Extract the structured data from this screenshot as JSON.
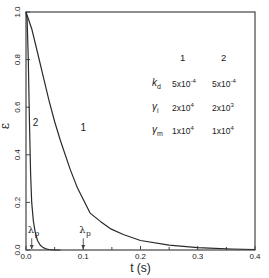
{
  "chart_data": {
    "type": "line",
    "title": "",
    "xlabel": "t (s)",
    "ylabel": "ε",
    "xlim": [
      0,
      0.4
    ],
    "ylim": [
      0,
      1.0
    ],
    "x_ticks": [
      "0.0",
      "0.1",
      "0.2",
      "0.3",
      "0.4"
    ],
    "x_tick_values": [
      0,
      0.1,
      0.2,
      0.3,
      0.4
    ],
    "x_minor_ticks": [
      0.05,
      0.15,
      0.25,
      0.35
    ],
    "y_ticks": [
      "0.0",
      "0.2",
      "0.4",
      "0.6",
      "0.8",
      "1.0"
    ],
    "y_tick_values": [
      0,
      0.2,
      0.4,
      0.6,
      0.8,
      1.0
    ],
    "grid": false,
    "series": [
      {
        "name": "1",
        "label_pos": [
          0.095,
          0.5
        ],
        "x": [
          0,
          0.01,
          0.02,
          0.03,
          0.04,
          0.05,
          0.06,
          0.077,
          0.09,
          0.112,
          0.13,
          0.147,
          0.17,
          0.2,
          0.25,
          0.3,
          0.32,
          0.36,
          0.4
        ],
        "y": [
          1.0,
          0.93,
          0.83,
          0.73,
          0.63,
          0.54,
          0.46,
          0.34,
          0.26,
          0.155,
          0.12,
          0.09,
          0.065,
          0.04,
          0.02,
          0.01,
          0.008,
          0.004,
          0.002
        ]
      },
      {
        "name": "2",
        "label_pos": [
          0.012,
          0.52
        ],
        "x": [
          0,
          0.002,
          0.004,
          0.006,
          0.008,
          0.01,
          0.013,
          0.016,
          0.02,
          0.025,
          0.03,
          0.035,
          0.04,
          0.05,
          0.06
        ],
        "y": [
          1.0,
          0.97,
          0.8,
          0.55,
          0.32,
          0.2,
          0.12,
          0.075,
          0.04,
          0.02,
          0.01,
          0.005,
          0.002,
          0.0,
          0.0
        ]
      }
    ],
    "annotations": [
      {
        "text": "λp",
        "series": "2",
        "x": 0.01,
        "arrow_to_y": 0.0,
        "label_y": 0.07
      },
      {
        "text": "λp",
        "series": "1",
        "x": 0.1,
        "arrow_to_y": 0.0,
        "label_y": 0.07
      }
    ],
    "legend_table": {
      "columns": [
        "1",
        "2"
      ],
      "rows": [
        {
          "symbol": "k",
          "sub": "d",
          "values": [
            {
              "m": "5x10",
              "e": "-4"
            },
            {
              "m": "5x10",
              "e": "-4"
            }
          ]
        },
        {
          "symbol": "γ",
          "sub": "i",
          "values": [
            {
              "m": "2x10",
              "e": "4"
            },
            {
              "m": "2x10",
              "e": "3"
            }
          ]
        },
        {
          "symbol": "γ",
          "sub": "m",
          "values": [
            {
              "m": "1x10",
              "e": "4"
            },
            {
              "m": "1x10",
              "e": "4"
            }
          ]
        }
      ]
    },
    "colors": {
      "line": "#2a2a2a",
      "axis": "#444444",
      "text": "#222222"
    }
  },
  "legend": {
    "col1": "1",
    "col2": "2",
    "kd_sym": "k",
    "kd_sub": "d",
    "kd_v1": "5x10",
    "kd_e1": "-4",
    "kd_v2": "5x10",
    "kd_e2": "-4",
    "gi_sym": "γ",
    "gi_sub": "i",
    "gi_v1": "2x10",
    "gi_e1": "4",
    "gi_v2": "2x10",
    "gi_e2": "3",
    "gm_sym": "γ",
    "gm_sub": "m",
    "gm_v1": "1x10",
    "gm_e1": "4",
    "gm_v2": "1x10",
    "gm_e2": "4"
  }
}
